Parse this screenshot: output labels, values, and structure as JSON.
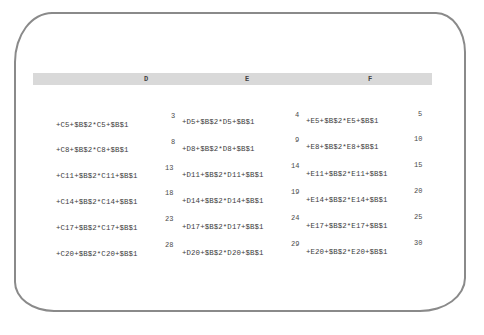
{
  "columns": [
    "D",
    "E",
    "F"
  ],
  "rows": [
    {
      "numbers": [
        "3",
        "4",
        "5"
      ],
      "cells": [
        "+C5+$B$2*C5+$B$1",
        "+D5+$B$2*D5+$B$1",
        "+E5+$B$2*E5+$B$1"
      ]
    },
    {
      "numbers": [
        "8",
        "9",
        "10"
      ],
      "cells": [
        "+C8+$B$2*C8+$B$1",
        "+D8+$B$2*D8+$B$1",
        "+E8+$B$2*E8+$B$1"
      ]
    },
    {
      "numbers": [
        "13",
        "14",
        "15"
      ],
      "cells": [
        "+C11+$B$2*C11+$B$1",
        "+D11+$B$2*D11+$B$1",
        "+E11+$B$2*E11+$B$1"
      ]
    },
    {
      "numbers": [
        "18",
        "19",
        "20"
      ],
      "cells": [
        "+C14+$B$2*C14+$B$1",
        "+D14+$B$2*D14+$B$1",
        "+E14+$B$2*E14+$B$1"
      ]
    },
    {
      "numbers": [
        "23",
        "24",
        "25"
      ],
      "cells": [
        "+C17+$B$2*C17+$B$1",
        "+D17+$B$2*D17+$B$1",
        "+E17+$B$2*E17+$B$1"
      ]
    },
    {
      "numbers": [
        "28",
        "29",
        "30"
      ],
      "cells": [
        "+C20+$B$2*C20+$B$1",
        "+D20+$B$2*D20+$B$1",
        "+E20+$B$2*E20+$B$1"
      ]
    }
  ],
  "colors": {
    "header_bg": "#d9d9d9",
    "screen_border": "#8a8a8a",
    "text": "#3c3c3c"
  }
}
